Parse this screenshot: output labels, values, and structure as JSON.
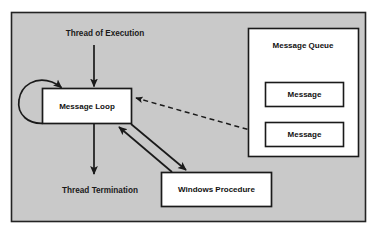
{
  "canvas": {
    "width": 374,
    "height": 236,
    "page_background": "#ffffff",
    "panel_background": "#c9c9c9",
    "panel_border_color": "#232323",
    "box_fill": "#ffffff",
    "box_border_color": "#1a1a1a",
    "line_color": "#1a1a1a",
    "text_color": "#111111"
  },
  "diagram": {
    "type": "flow-diagram",
    "nodes": [
      {
        "id": "message-loop",
        "label": "Message Loop",
        "shape": "rectangle",
        "x": 42,
        "y": 88,
        "width": 90,
        "height": 36
      },
      {
        "id": "windows-procedure",
        "label": "Windows Procedure",
        "shape": "rectangle",
        "x": 161,
        "y": 172,
        "width": 111,
        "height": 35
      },
      {
        "id": "message-queue",
        "label": "Message Queue",
        "shape": "rectangle",
        "x": 248,
        "y": 28,
        "width": 110,
        "height": 128
      },
      {
        "id": "message-1",
        "label": "Message",
        "shape": "rectangle",
        "x": 265,
        "y": 82,
        "width": 78,
        "height": 24
      },
      {
        "id": "message-2",
        "label": "Message",
        "shape": "rectangle",
        "x": 265,
        "y": 122,
        "width": 78,
        "height": 24
      }
    ],
    "free_labels": [
      {
        "id": "thread-of-execution",
        "text": "Thread of Execution",
        "x": 105,
        "y": 34
      },
      {
        "id": "thread-termination",
        "text": "Thread Termination",
        "x": 100,
        "y": 191
      }
    ],
    "edges": [
      {
        "id": "edge-thread-start",
        "from": "thread-of-execution",
        "to": "message-loop",
        "style": "solid",
        "arrow": "end"
      },
      {
        "id": "edge-thread-end",
        "from": "message-loop",
        "to": "thread-termination",
        "style": "solid",
        "arrow": "end"
      },
      {
        "id": "edge-self-loop",
        "from": "message-loop",
        "to": "message-loop",
        "style": "solid",
        "arrow": "end"
      },
      {
        "id": "edge-dispatch",
        "from": "message-loop",
        "to": "windows-procedure",
        "style": "solid",
        "arrow": "end"
      },
      {
        "id": "edge-return",
        "from": "windows-procedure",
        "to": "message-loop",
        "style": "solid",
        "arrow": "end"
      },
      {
        "id": "edge-message-retrieval",
        "from": "message-2",
        "to": "message-loop",
        "style": "dashed",
        "arrow": "end"
      }
    ]
  }
}
